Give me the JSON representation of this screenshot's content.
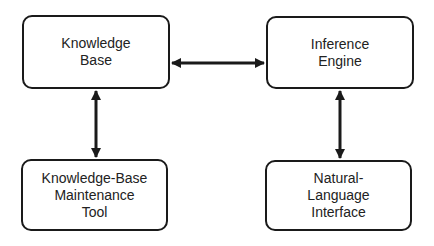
{
  "diagram": {
    "nodes": [
      {
        "id": "knowledge-base",
        "lines": [
          "Knowledge",
          "Base"
        ]
      },
      {
        "id": "inference-engine",
        "lines": [
          "Inference",
          "Engine"
        ]
      },
      {
        "id": "kb-maintenance-tool",
        "lines": [
          "Knowledge-Base",
          "Maintenance",
          "Tool"
        ]
      },
      {
        "id": "nl-interface",
        "lines": [
          "Natural-",
          "Language",
          "Interface"
        ]
      }
    ],
    "edges": [
      {
        "from": "knowledge-base",
        "to": "inference-engine",
        "direction": "bidirectional"
      },
      {
        "from": "knowledge-base",
        "to": "kb-maintenance-tool",
        "direction": "bidirectional"
      },
      {
        "from": "inference-engine",
        "to": "nl-interface",
        "direction": "bidirectional"
      }
    ]
  }
}
